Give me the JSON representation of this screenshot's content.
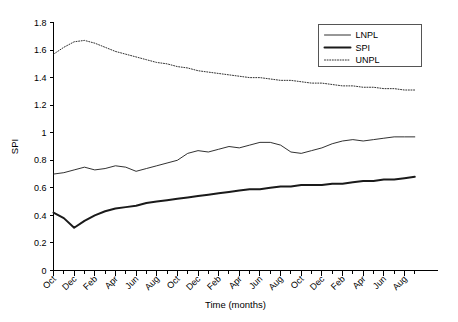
{
  "chart_data": {
    "type": "line",
    "title": "",
    "xlabel": "Time (months)",
    "ylabel": "SPI",
    "ylim": [
      0,
      1.8
    ],
    "ytick_labels": [
      "0",
      "0.2",
      "0.4",
      "0.6",
      "0.8",
      "1",
      "1.2",
      "1.4",
      "1.6",
      "1.8"
    ],
    "ytick_values": [
      0,
      0.2,
      0.4,
      0.6,
      0.8,
      1.0,
      1.2,
      1.4,
      1.6,
      1.8
    ],
    "grid": false,
    "legend_position": "top-right",
    "x_minor_ticks_every_months": 1,
    "x_labels_every_months": 2,
    "categories": [
      "Oct",
      "Nov",
      "Dec",
      "Jan",
      "Feb",
      "Mar",
      "Apr",
      "May",
      "Jun",
      "Jul",
      "Aug",
      "Sep",
      "Oct",
      "Nov",
      "Dec",
      "Jan",
      "Feb",
      "Mar",
      "Apr",
      "May",
      "Jun",
      "Jul",
      "Aug",
      "Sep",
      "Oct",
      "Nov",
      "Dec",
      "Jan",
      "Feb",
      "Mar",
      "Apr",
      "May",
      "Jun",
      "Jul",
      "Aug",
      "Sep"
    ],
    "xtick_labels": [
      "Oct",
      "Dec",
      "Feb",
      "Apr",
      "Jun",
      "Aug",
      "Oct",
      "Dec",
      "Feb",
      "Apr",
      "Jun",
      "Aug",
      "Oct",
      "Dec",
      "Feb",
      "Apr",
      "Jun",
      "Aug"
    ],
    "series": [
      {
        "name": "LNPL",
        "style": "solid-thin",
        "values": [
          0.7,
          0.71,
          0.73,
          0.75,
          0.73,
          0.74,
          0.76,
          0.75,
          0.72,
          0.74,
          0.76,
          0.78,
          0.8,
          0.85,
          0.87,
          0.86,
          0.88,
          0.9,
          0.89,
          0.91,
          0.93,
          0.93,
          0.91,
          0.86,
          0.85,
          0.87,
          0.89,
          0.92,
          0.94,
          0.95,
          0.94,
          0.95,
          0.96,
          0.97,
          0.97,
          0.97
        ]
      },
      {
        "name": "SPI",
        "style": "solid-thick",
        "values": [
          0.42,
          0.38,
          0.31,
          0.36,
          0.4,
          0.43,
          0.45,
          0.46,
          0.47,
          0.49,
          0.5,
          0.51,
          0.52,
          0.53,
          0.54,
          0.55,
          0.56,
          0.57,
          0.58,
          0.59,
          0.59,
          0.6,
          0.61,
          0.61,
          0.62,
          0.62,
          0.62,
          0.63,
          0.63,
          0.64,
          0.65,
          0.65,
          0.66,
          0.66,
          0.67,
          0.68
        ]
      },
      {
        "name": "UNPL",
        "style": "dotted",
        "values": [
          1.57,
          1.62,
          1.66,
          1.67,
          1.65,
          1.62,
          1.59,
          1.57,
          1.55,
          1.53,
          1.51,
          1.5,
          1.48,
          1.47,
          1.45,
          1.44,
          1.43,
          1.42,
          1.41,
          1.4,
          1.4,
          1.39,
          1.38,
          1.38,
          1.37,
          1.36,
          1.36,
          1.35,
          1.34,
          1.34,
          1.33,
          1.33,
          1.32,
          1.32,
          1.31,
          1.31
        ]
      }
    ]
  },
  "legend": {
    "items": [
      {
        "label": "LNPL"
      },
      {
        "label": "SPI"
      },
      {
        "label": "UNPL"
      }
    ]
  },
  "axes": {
    "y_title": "SPI",
    "x_title": "Time (months)"
  },
  "colors": {
    "line": "#1a1a1a",
    "axis": "#000000",
    "background": "#ffffff"
  }
}
